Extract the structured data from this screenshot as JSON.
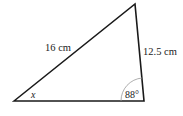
{
  "diagram": {
    "type": "triangle",
    "vertices": {
      "bottom_left": [
        14,
        101
      ],
      "top": [
        135,
        4
      ],
      "bottom_right": [
        144,
        101
      ]
    },
    "labels": {
      "side_hypotenuse": "16 cm",
      "side_right": "12.5 cm",
      "angle_bottom_left": "x",
      "angle_bottom_right": "88°"
    },
    "colors": {
      "stroke": "#1a1a1a",
      "arc": "#999999",
      "text": "#222222"
    }
  }
}
